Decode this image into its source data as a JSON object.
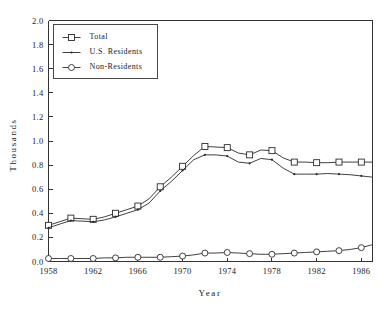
{
  "chart_data": {
    "type": "line",
    "title": "",
    "xlabel": "Year",
    "ylabel": "Thousands",
    "xlim": [
      1958,
      1987
    ],
    "ylim": [
      0.0,
      2.0
    ],
    "grid": false,
    "legend_position": "top-left",
    "x_ticks": [
      1958,
      1962,
      1966,
      1970,
      1974,
      1978,
      1982,
      1986
    ],
    "x_tick_labels": [
      "1958",
      "1962",
      "1966",
      "1970",
      "1974",
      "1978",
      "1982",
      "1986"
    ],
    "y_ticks": [
      0.0,
      0.2,
      0.4,
      0.6,
      0.8,
      1.0,
      1.2,
      1.4,
      1.6,
      1.8,
      2.0
    ],
    "y_tick_labels": [
      "0.0",
      "0.2",
      "0.4",
      "0.6",
      "0.8",
      "1.0",
      "1.2",
      "1.4",
      "1.6",
      "1.8",
      "2.0"
    ],
    "x": [
      1958,
      1959,
      1960,
      1961,
      1962,
      1963,
      1964,
      1965,
      1966,
      1967,
      1968,
      1969,
      1970,
      1971,
      1972,
      1973,
      1974,
      1975,
      1976,
      1977,
      1978,
      1979,
      1980,
      1981,
      1982,
      1983,
      1984,
      1985,
      1986,
      1987
    ],
    "series": [
      {
        "name": "Total",
        "marker": "square",
        "marker_every": 2,
        "values": [
          0.3,
          0.33,
          0.36,
          0.355,
          0.35,
          0.37,
          0.4,
          0.43,
          0.46,
          0.52,
          0.62,
          0.7,
          0.79,
          0.88,
          0.955,
          0.95,
          0.945,
          0.9,
          0.885,
          0.925,
          0.92,
          0.86,
          0.825,
          0.825,
          0.82,
          0.82,
          0.825,
          0.825,
          0.825,
          0.825
        ]
      },
      {
        "name": "U.S. Residents",
        "marker": "dot",
        "marker_every": 2,
        "values": [
          0.28,
          0.31,
          0.34,
          0.335,
          0.33,
          0.345,
          0.37,
          0.4,
          0.43,
          0.485,
          0.585,
          0.665,
          0.755,
          0.845,
          0.885,
          0.885,
          0.875,
          0.825,
          0.815,
          0.855,
          0.845,
          0.775,
          0.725,
          0.725,
          0.725,
          0.73,
          0.725,
          0.72,
          0.71,
          0.7
        ]
      },
      {
        "name": "Non-Residents",
        "marker": "circle",
        "marker_every": 2,
        "values": [
          0.025,
          0.025,
          0.025,
          0.025,
          0.025,
          0.03,
          0.03,
          0.035,
          0.035,
          0.035,
          0.035,
          0.04,
          0.045,
          0.055,
          0.07,
          0.07,
          0.075,
          0.07,
          0.065,
          0.06,
          0.06,
          0.065,
          0.07,
          0.075,
          0.08,
          0.085,
          0.09,
          0.1,
          0.115,
          0.14
        ]
      }
    ]
  },
  "legend": {
    "items": [
      {
        "label": "Total",
        "marker": "square"
      },
      {
        "label": "U.S. Residents",
        "marker": "dot"
      },
      {
        "label": "Non-Residents",
        "marker": "circle"
      }
    ]
  }
}
